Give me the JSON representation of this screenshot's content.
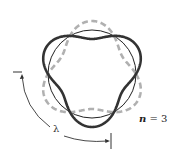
{
  "figure": {
    "labels": {
      "n_var": "n",
      "n_eq": " = 3",
      "lambda": "λ"
    },
    "geometry": {
      "center": [
        92,
        74
      ],
      "radius": 44,
      "amplitude": 9,
      "n": 3
    },
    "colors": {
      "solid_wave": "#333333",
      "dashed_wave": "#b0b0b0",
      "orbit": "#222222",
      "annotation": "#333333"
    }
  }
}
